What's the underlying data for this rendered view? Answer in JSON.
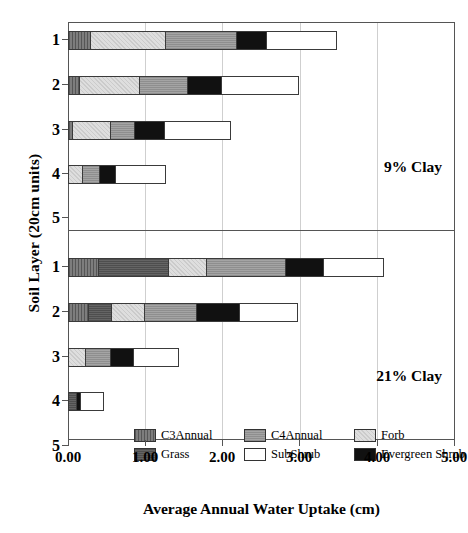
{
  "chart_data": {
    "type": "bar",
    "orientation": "horizontal",
    "stacked": true,
    "title": "",
    "xlabel": "Average Annual Water Uptake (cm)",
    "ylabel": "Soil Layer (20cm units)",
    "xlim": [
      0.0,
      5.0
    ],
    "xticks": [
      "0.00",
      "1.00",
      "2.00",
      "3.00",
      "4.00",
      "5.00"
    ],
    "xtick_values": [
      0.0,
      1.0,
      2.0,
      3.0,
      4.0,
      5.0
    ],
    "grid": true,
    "legend_position": "bottom-inside",
    "legend_entries": [
      "C3Annual",
      "C4Annual",
      "Forb",
      "Grass",
      "SubShrub",
      "Evergreen Shrub"
    ],
    "series_colors": {
      "C3Annual": "#6e6e6e",
      "C4Annual": "#9a9a9a",
      "Forb": "#d6d6d6",
      "Grass": "#5a5a5a",
      "SubShrub": "#ffffff",
      "Evergreen Shrub": "#111111"
    },
    "panels": [
      {
        "annotation": "9% Clay",
        "categories": [
          "1",
          "2",
          "3",
          "4",
          "5"
        ],
        "series": [
          {
            "name": "C3Annual",
            "values": [
              0.29,
              0.14,
              0.05,
              0.0,
              0.0
            ]
          },
          {
            "name": "Grass",
            "values": [
              0.0,
              0.0,
              0.0,
              0.0,
              0.0
            ]
          },
          {
            "name": "Forb",
            "values": [
              0.97,
              0.78,
              0.49,
              0.18,
              0.0
            ]
          },
          {
            "name": "C4Annual",
            "values": [
              0.91,
              0.62,
              0.31,
              0.22,
              0.0
            ]
          },
          {
            "name": "Evergreen Shrub",
            "values": [
              0.39,
              0.44,
              0.39,
              0.21,
              0.0
            ]
          },
          {
            "name": "SubShrub",
            "values": [
              0.92,
              1.01,
              0.87,
              0.66,
              0.0
            ]
          }
        ],
        "totals": [
          3.47,
          3.0,
          2.11,
          1.27,
          0.0
        ]
      },
      {
        "annotation": "21% Clay",
        "categories": [
          "1",
          "2",
          "3",
          "4",
          "5"
        ],
        "series": [
          {
            "name": "C3Annual",
            "values": [
              0.39,
              0.26,
              0.0,
              0.0,
              0.0
            ]
          },
          {
            "name": "Grass",
            "values": [
              0.91,
              0.3,
              0.0,
              0.1,
              0.0
            ]
          },
          {
            "name": "Forb",
            "values": [
              0.49,
              0.43,
              0.22,
              0.0,
              0.0
            ]
          },
          {
            "name": "C4Annual",
            "values": [
              1.02,
              0.67,
              0.32,
              0.0,
              0.0
            ]
          },
          {
            "name": "Evergreen Shrub",
            "values": [
              0.49,
              0.56,
              0.3,
              0.06,
              0.0
            ]
          },
          {
            "name": "SubShrub",
            "values": [
              0.8,
              0.76,
              0.6,
              0.31,
              0.0
            ]
          }
        ],
        "totals": [
          4.1,
          2.98,
          1.44,
          0.47,
          0.0
        ]
      }
    ]
  },
  "axes": {
    "y_title": "Soil Layer (20cm units)",
    "x_title": "Average Annual Water Uptake (cm)",
    "x_labels": [
      "0.00",
      "1.00",
      "2.00",
      "3.00",
      "4.00",
      "5.00"
    ],
    "y_labels_top": [
      "1",
      "2",
      "3",
      "4",
      "5"
    ],
    "y_labels_bottom": [
      "1",
      "2",
      "3",
      "4",
      "5"
    ]
  },
  "annotations": {
    "top_panel": "9% Clay",
    "bottom_panel": "21% Clay"
  },
  "legend": {
    "items": [
      {
        "label": "C3Annual",
        "swatch": "c3"
      },
      {
        "label": "C4Annual",
        "swatch": "c4"
      },
      {
        "label": "Forb",
        "swatch": "forb"
      },
      {
        "label": "Grass",
        "swatch": "grass"
      },
      {
        "label": "SubShrub",
        "swatch": "sub"
      },
      {
        "label": "Evergreen Shrub",
        "swatch": "ev"
      }
    ]
  }
}
